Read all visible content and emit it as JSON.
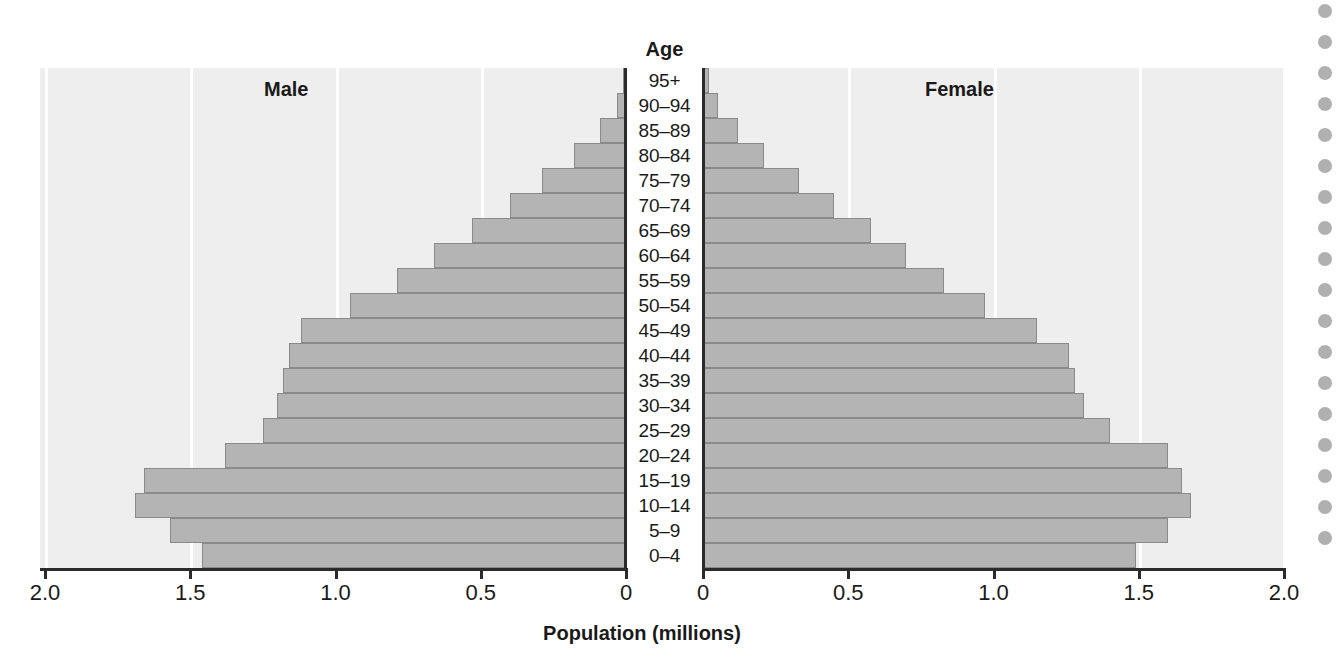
{
  "chart_data": {
    "type": "bar",
    "title": "",
    "subtitle": "",
    "orientation": "horizontal-diverging",
    "xlabel": "Population (millions)",
    "ylabel": "Age",
    "center_axis_label": "Age",
    "left_panel_label": "Male",
    "right_panel_label": "Female",
    "xlim_left": [
      2.0,
      0
    ],
    "xlim_right": [
      0,
      2.0
    ],
    "x_ticks_left": [
      "2.0",
      "1.5",
      "1.0",
      "0.5",
      "0"
    ],
    "x_ticks_right": [
      "0",
      "0.5",
      "1.0",
      "1.5",
      "2.0"
    ],
    "x_tick_values": [
      0,
      0.5,
      1.0,
      1.5,
      2.0
    ],
    "grid": true,
    "grid_color": "#ffffff",
    "plot_background": "#eeeeee",
    "bar_fill": "#b4b4b4",
    "bar_edge": "#8a8a8a",
    "legend": null,
    "categories": [
      "95+",
      "90–94",
      "85–89",
      "80–84",
      "75–79",
      "70–74",
      "65–69",
      "60–64",
      "55–59",
      "50–54",
      "45–49",
      "40–44",
      "35–39",
      "30–34",
      "25–29",
      "20–24",
      "15–19",
      "10–14",
      "5–9",
      "0–4"
    ],
    "series": [
      {
        "name": "Male",
        "side": "left",
        "values": [
          0.01,
          0.03,
          0.09,
          0.18,
          0.29,
          0.4,
          0.53,
          0.66,
          0.79,
          0.95,
          1.12,
          1.16,
          1.18,
          1.2,
          1.25,
          1.38,
          1.66,
          1.69,
          1.57,
          1.46
        ]
      },
      {
        "name": "Female",
        "side": "right",
        "values": [
          0.02,
          0.05,
          0.12,
          0.21,
          0.33,
          0.45,
          0.58,
          0.7,
          0.83,
          0.97,
          1.15,
          1.26,
          1.28,
          1.31,
          1.4,
          1.6,
          1.65,
          1.68,
          1.6,
          1.49
        ]
      }
    ]
  },
  "scrollbar": {
    "dot_count": 18,
    "dot_color": "#b0b0b0"
  }
}
